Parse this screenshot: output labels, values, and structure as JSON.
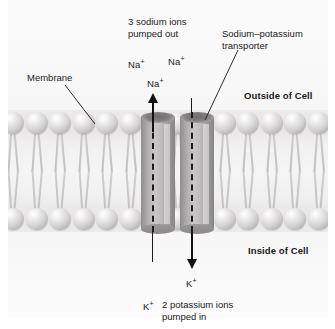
{
  "diagram": {
    "labels": {
      "sodium_out": "3 sodium ions\npumped out",
      "transporter": "Sodium–potassium\ntransporter",
      "membrane": "Membrane",
      "outside": "Outside of Cell",
      "inside": "Inside of Cell",
      "potassium_in": "2 potassium ions\npumped in"
    },
    "ions": {
      "sodium": [
        {
          "label": "Na",
          "charge": "+"
        },
        {
          "label": "Na",
          "charge": "+"
        },
        {
          "label": "Na",
          "charge": "+"
        }
      ],
      "potassium": [
        {
          "label": "K",
          "charge": "+"
        },
        {
          "label": "K",
          "charge": "+"
        }
      ]
    },
    "arrows": [
      {
        "name": "sodium-efflux-arrow",
        "direction": "up"
      },
      {
        "name": "potassium-influx-arrow",
        "direction": "down"
      }
    ],
    "colors": {
      "background": "#ffffff",
      "plate": "#f7f7f7",
      "lipid_head": "#d3d1d1",
      "protein": "#a9a7a7",
      "line": "#1a1a1a"
    }
  }
}
